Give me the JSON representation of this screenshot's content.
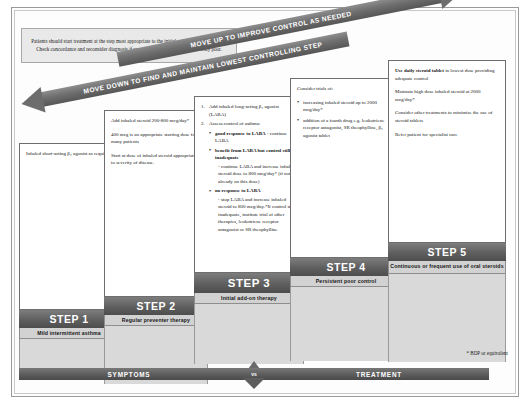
{
  "note": {
    "text": "Patients should start treatment at the step most appropriate to the initial severity of their asthma. Check concordance and reconsider diagnosis if response to treatment is unexpectedly poor."
  },
  "arrows": {
    "up": "MOVE UP TO IMPROVE CONTROL AS NEEDED",
    "down": "MOVE DOWN TO FIND AND MAINTAIN LOWEST CONTROLLING STEP"
  },
  "steps": [
    {
      "id": "step1",
      "title": "STEP 1",
      "subtitle": "Mild intermittent asthma",
      "paragraphs": [
        "Inhaled short-acting β₂ agonist as required"
      ]
    },
    {
      "id": "step2",
      "title": "STEP 2",
      "subtitle": "Regular preventer therapy",
      "paragraphs": [
        "Add inhaled steroid 200-800 mcg/day*",
        "400 mcg is an appropriate starting dose for many patients",
        "Start at dose of inhaled steroid appropriate to severity of disease."
      ]
    },
    {
      "id": "step3",
      "title": "STEP 3",
      "subtitle": "Initial add-on therapy",
      "items": [
        {
          "num": "1.",
          "text": "Add inhaled long-acting β₂ agonist (LABA)"
        },
        {
          "num": "2.",
          "text": "Assess control of asthma:"
        }
      ],
      "bullets": [
        {
          "bold": "good response to LABA",
          "rest": " - continue LABA",
          "dashes": []
        },
        {
          "bold": "benefit from LABA but control still inadequate",
          "rest": "",
          "dashes": [
            "- continue LABA and increase inhaled steroid dose to 800 mcg/day* (if not already on this dose)"
          ]
        },
        {
          "bold": "no response to LABA",
          "rest": "",
          "dashes": [
            "- stop LABA and increase inhaled steroid to 800 mcg/day.*If control still inadequate, institute trial of other therapies, leukotriene receptor antagonist or SR theophylline"
          ]
        }
      ]
    },
    {
      "id": "step4",
      "title": "STEP 4",
      "subtitle": "Persistent poor control",
      "lead": "Consider trials of:",
      "bullets": [
        "increasing inhaled steroid up to 2000 mcg/day*",
        "addition of a fourth drug e.g. leukotriene receptor antagonist, SR theophylline, β₂ agonist tablet"
      ]
    },
    {
      "id": "step5",
      "title": "STEP 5",
      "subtitle": "Continuous or frequent use of oral steroids",
      "paragraphs": [
        "Use daily steroid tablet in lowest dose providing adequate control",
        "Maintain high dose inhaled steroid at 2000 mcg/day*",
        "Consider other treatments to minimise the use of steroid tablets",
        "Refer patient for specialist care"
      ],
      "first_bold": "Use daily steroid tablet"
    }
  ],
  "balance": {
    "left_label": "SYMPTOMS",
    "vs_label": "vs",
    "right_label": "TREATMENT"
  },
  "footnote": "* BDP or equivalent"
}
